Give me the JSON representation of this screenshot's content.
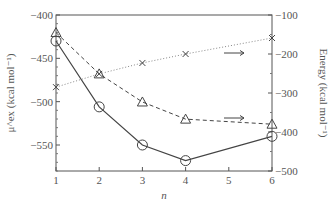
{
  "chart_data": {
    "type": "line",
    "title": "",
    "xlabel": "n",
    "ylabel_left": "μ^ex (kcal mol⁻¹)",
    "ylabel_right": "Energy (kcal mol⁻¹)",
    "x_ticks": [
      1,
      2,
      3,
      4,
      5,
      6
    ],
    "x_tick_labels": [
      "1",
      "2",
      "3",
      "4",
      "5",
      "6"
    ],
    "xlim": [
      1,
      6
    ],
    "ylim_left": [
      -580,
      -400
    ],
    "y_ticks_left": [
      -400,
      -450,
      -500,
      -550
    ],
    "y_tick_labels_left": [
      "−400",
      "−450",
      "−500",
      "−550"
    ],
    "ylim_right": [
      -500,
      -100
    ],
    "y_ticks_right": [
      -100,
      -200,
      -300,
      -400,
      -500
    ],
    "y_tick_labels_right": [
      "−100",
      "−200",
      "−300",
      "−400",
      "−500"
    ],
    "grid": false,
    "series": [
      {
        "name": "μex (circles, solid)",
        "axis": "left",
        "marker": "circle",
        "linestyle": "solid",
        "x": [
          1,
          2,
          3,
          4,
          6
        ],
        "values": [
          -430,
          -506,
          -550,
          -568,
          -540
        ]
      },
      {
        "name": "Energy (triangles, dashed)",
        "axis": "right",
        "marker": "triangle",
        "linestyle": "dashed",
        "x": [
          1,
          2,
          3,
          4,
          6
        ],
        "values": [
          -145,
          -251,
          -323,
          -367,
          -380
        ]
      },
      {
        "name": "Energy (crosses, dotted)",
        "axis": "right",
        "marker": "cross",
        "linestyle": "dotted",
        "x": [
          1,
          2,
          3,
          4,
          6
        ],
        "values": [
          -285,
          -251,
          -223,
          -200,
          -159
        ]
      }
    ],
    "annotations": [
      {
        "type": "arrow",
        "direction": "right",
        "note": "crosses series refers to right axis"
      },
      {
        "type": "arrow",
        "direction": "right",
        "note": "triangles series refers to right axis"
      }
    ]
  }
}
